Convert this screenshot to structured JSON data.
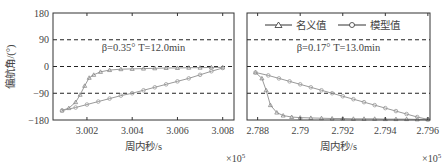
{
  "chart_data": [
    {
      "type": "line",
      "title": "",
      "annotation": "β=0.35° T=12.0min",
      "xlabel": "周内秒/s",
      "ylabel": "偏航角/(°)",
      "x_multiplier": "×10^5",
      "xlim": [
        3.0005,
        3.0085
      ],
      "ylim": [
        -180,
        180
      ],
      "xticks": [
        "3.002",
        "3.004",
        "3.006",
        "3.008"
      ],
      "yticks": [
        "180",
        "90",
        "0",
        "-90",
        "-180"
      ],
      "grid": "dashed horizontal at 90, 0, -90",
      "series": [
        {
          "name": "名义值",
          "marker": "triangle",
          "x": [
            3.0009,
            3.0012,
            3.0015,
            3.0017,
            3.0019,
            3.0021,
            3.0023,
            3.0026,
            3.003,
            3.0035,
            3.004,
            3.0045,
            3.005,
            3.0055,
            3.006,
            3.0065,
            3.007,
            3.0075,
            3.008
          ],
          "y": [
            -148,
            -140,
            -120,
            -95,
            -65,
            -38,
            -28,
            -18,
            -12,
            -9,
            -8,
            -7,
            -6,
            -5,
            -5,
            -4,
            -4,
            -3,
            -3
          ]
        },
        {
          "name": "模型值",
          "marker": "circle",
          "x": [
            3.0009,
            3.0015,
            3.002,
            3.0025,
            3.003,
            3.0035,
            3.004,
            3.0045,
            3.005,
            3.0055,
            3.006,
            3.0065,
            3.007,
            3.0075,
            3.008
          ],
          "y": [
            -148,
            -138,
            -128,
            -118,
            -108,
            -98,
            -90,
            -80,
            -70,
            -60,
            -50,
            -40,
            -28,
            -16,
            -5
          ]
        }
      ]
    },
    {
      "type": "line",
      "title": "",
      "annotation": "β=0.17° T=13.0min",
      "xlabel": "周内秒/s",
      "ylabel": "",
      "x_multiplier": "×10^5",
      "xlim": [
        2.7875,
        2.7961
      ],
      "ylim": [
        -180,
        180
      ],
      "xticks": [
        "2.788",
        "2.79",
        "2.792",
        "2.794",
        "2.796"
      ],
      "yticks": [],
      "grid": "dashed horizontal at 90, 0, -90",
      "legend": {
        "position": "top",
        "entries": [
          "名义值",
          "模型值"
        ]
      },
      "series": [
        {
          "name": "名义值",
          "marker": "triangle",
          "x": [
            2.7879,
            2.7882,
            2.7884,
            2.7886,
            2.7889,
            2.7892,
            2.7896,
            2.79,
            2.7905,
            2.791,
            2.7915,
            2.792,
            2.7925,
            2.793,
            2.7935,
            2.794,
            2.7945,
            2.795,
            2.7955,
            2.796
          ],
          "y": [
            -20,
            -40,
            -80,
            -130,
            -155,
            -165,
            -170,
            -172,
            -173,
            -174,
            -175,
            -175,
            -176,
            -176,
            -176,
            -177,
            -177,
            -177,
            -178,
            -178
          ]
        },
        {
          "name": "模型值",
          "marker": "circle",
          "x": [
            2.7879,
            2.7885,
            2.789,
            2.7895,
            2.79,
            2.7905,
            2.791,
            2.7915,
            2.792,
            2.7925,
            2.793,
            2.7935,
            2.794,
            2.7945,
            2.795,
            2.7955,
            2.796
          ],
          "y": [
            -20,
            -30,
            -40,
            -50,
            -60,
            -70,
            -80,
            -90,
            -100,
            -110,
            -120,
            -130,
            -140,
            -150,
            -160,
            -170,
            -178
          ]
        }
      ]
    }
  ],
  "legend": {
    "nominal": "名义值",
    "model": "模型值"
  }
}
